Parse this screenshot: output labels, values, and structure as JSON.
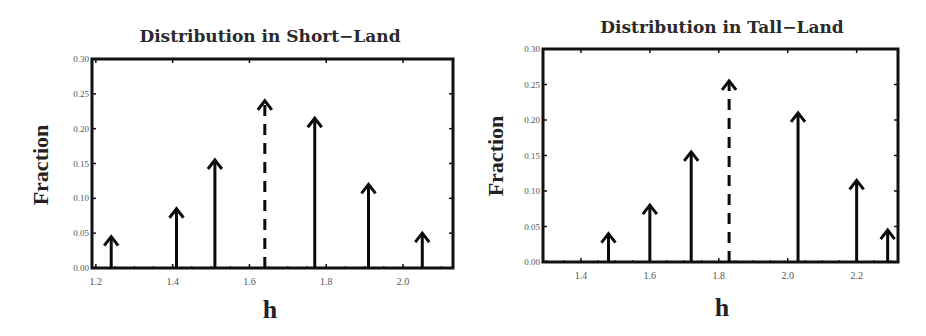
{
  "chart_data": [
    {
      "type": "stem",
      "title": "Distribution in Short−Land",
      "xlabel": "h",
      "ylabel": "Fraction",
      "xlim": [
        1.19,
        2.13
      ],
      "ylim": [
        0.0,
        0.3
      ],
      "xticks": [
        1.2,
        1.4,
        1.6,
        1.8,
        2.0
      ],
      "xtick_labels": [
        "1.2",
        "1.4",
        "1.6",
        "1.8",
        "2.0"
      ],
      "yticks": [
        0.0,
        0.05,
        0.1,
        0.15,
        0.2,
        0.25,
        0.3
      ],
      "ytick_labels": [
        "0.00",
        "0.05",
        "0.10",
        "0.15",
        "0.20",
        "0.25",
        "0.30"
      ],
      "grid": false,
      "series": [
        {
          "name": "distribution",
          "style": "solid-arrow",
          "x": [
            1.24,
            1.41,
            1.51,
            1.77,
            1.91,
            2.05
          ],
          "values": [
            0.045,
            0.085,
            0.155,
            0.215,
            0.12,
            0.05
          ]
        },
        {
          "name": "mean",
          "style": "dashed-arrow",
          "x": [
            1.64
          ],
          "values": [
            0.24
          ]
        }
      ],
      "frame": {
        "left": 92,
        "top": 59,
        "right": 453,
        "bottom": 268
      }
    },
    {
      "type": "stem",
      "title": "Distribution in Tall−Land",
      "xlabel": "h",
      "ylabel": "Fraction",
      "xlim": [
        1.29,
        2.32
      ],
      "ylim": [
        0.0,
        0.3
      ],
      "xticks": [
        1.4,
        1.6,
        1.8,
        2.0,
        2.2
      ],
      "xtick_labels": [
        "1.4",
        "1.6",
        "1.8",
        "2.0",
        "2.2"
      ],
      "yticks": [
        0.0,
        0.05,
        0.1,
        0.15,
        0.2,
        0.25,
        0.3
      ],
      "ytick_labels": [
        "0.00",
        "0.05",
        "0.10",
        "0.15",
        "0.20",
        "0.25",
        "0.30"
      ],
      "grid": false,
      "series": [
        {
          "name": "distribution",
          "style": "solid-arrow",
          "x": [
            1.48,
            1.6,
            1.72,
            2.03,
            2.2,
            2.29
          ],
          "values": [
            0.04,
            0.08,
            0.155,
            0.21,
            0.115,
            0.045
          ]
        },
        {
          "name": "mean",
          "style": "dashed-arrow",
          "x": [
            1.83
          ],
          "values": [
            0.255
          ]
        }
      ],
      "frame": {
        "left": 543,
        "top": 49,
        "right": 898,
        "bottom": 262
      }
    }
  ],
  "layout": {
    "panels": [
      {
        "title_x": 270,
        "title_y": 42,
        "ylabel_x": 48,
        "ylabel_y": 165,
        "xlabel_x": 270,
        "xlabel_y": 318
      },
      {
        "title_x": 722,
        "title_y": 33,
        "ylabel_x": 503,
        "ylabel_y": 156,
        "xlabel_x": 722,
        "xlabel_y": 316
      }
    ],
    "colors": {
      "frame": "#111111",
      "stem": "#0a0a0a",
      "tick_text": "#555555",
      "title": "#2a2a2a"
    }
  }
}
